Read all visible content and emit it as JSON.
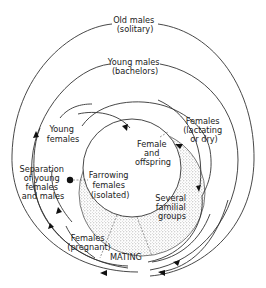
{
  "diagram": {
    "type": "life-cycle / social organization diagram",
    "labels": {
      "old_males": [
        "Old males",
        "(solitary)"
      ],
      "young_males": [
        "Young males",
        "(bachelors)"
      ],
      "young_females": [
        "Young",
        "females"
      ],
      "females_lactating": [
        "Females",
        "(lactating",
        "or dry)"
      ],
      "female_offspring": [
        "Female",
        "and",
        "offspring"
      ],
      "farrowing": [
        "Farrowing",
        "females",
        "(isolated)"
      ],
      "separation": [
        "Separation",
        "of young",
        "females",
        "and males"
      ],
      "familial_groups": [
        "Several",
        "familial",
        "groups"
      ],
      "females_pregnant": [
        "Females",
        "(pregnant)"
      ],
      "mating": "MATING"
    },
    "colors": {
      "line": "#333333",
      "stipple": "#c8c8c8",
      "background": "#ffffff"
    }
  }
}
